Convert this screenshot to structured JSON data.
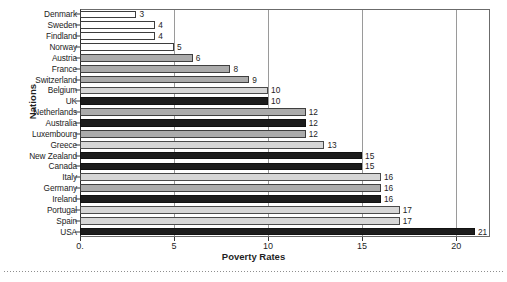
{
  "chart_data": {
    "type": "bar",
    "orientation": "horizontal",
    "title": "",
    "xlabel": "Poverty Rates",
    "ylabel": "Nations",
    "xlim": [
      0,
      21.8
    ],
    "grid": true,
    "legend": "none",
    "xticks": [
      "0.",
      "5",
      "10",
      "15",
      "20"
    ],
    "xtick_values": [
      0,
      5,
      10,
      15,
      20
    ],
    "categories": [
      "Denmark",
      "Sweden",
      "Findland",
      "Norway",
      "Austria",
      "France",
      "Switzerland",
      "Belgium",
      "UK",
      "Netherlands",
      "Australia",
      "Luxembourg",
      "Greece",
      "New Zealand",
      "Canada",
      "Italy",
      "Germany",
      "Ireland",
      "Portugal",
      "Spain",
      "USA"
    ],
    "values": [
      3,
      4,
      4,
      5,
      6,
      8,
      9,
      10,
      10,
      12,
      12,
      12,
      13,
      15,
      15,
      16,
      16,
      16,
      17,
      17,
      21
    ],
    "bar_shades": [
      "white",
      "white",
      "white",
      "white",
      "mid",
      "mid",
      "mid",
      "light",
      "dark",
      "mid",
      "dark",
      "mid",
      "light",
      "dark",
      "dark",
      "light",
      "mid",
      "dark",
      "light",
      "light",
      "dark"
    ],
    "data_labels": [
      "3",
      "4",
      "4",
      "5",
      "6",
      "8",
      "9",
      "10",
      "10",
      "12",
      "12",
      "12",
      "13",
      "15",
      "15",
      "16",
      "16",
      "16",
      "17",
      "17",
      "21"
    ]
  },
  "palette": {
    "white": "#ffffff",
    "light": "#d6d6d6",
    "mid": "#ababab",
    "dark": "#1c1c1c",
    "frame": "#6b6b6b",
    "grid": "#9a9a9a",
    "text": "#1f1f1f"
  }
}
